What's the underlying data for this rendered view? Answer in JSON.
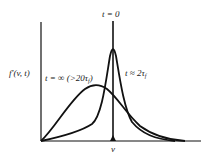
{
  "figure": {
    "ylabel": "f'(v, t)",
    "xlabel": "v",
    "curves": [
      {
        "label": "t = 0",
        "description": "delta spike at v"
      },
      {
        "label": "t ≈ 2τ",
        "subscript": "f",
        "description": "narrow peaked distribution"
      },
      {
        "label": "t = ∞ (>20τ",
        "subscript": "f",
        "suffix": ")",
        "description": "broad equilibrium distribution"
      }
    ],
    "stroke_color": "#111111"
  }
}
